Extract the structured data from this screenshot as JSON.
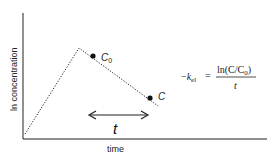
{
  "diagram": {
    "type": "pharmacokinetic log-concentration vs time plot",
    "axes": {
      "xlabel": "time",
      "ylabel": "ln concentration"
    },
    "points": {
      "c0_label": "C",
      "c0_subscript": "0",
      "c_label": "C"
    },
    "interval_label": "t",
    "formula": {
      "lhs_minus": "−",
      "lhs_k": "k",
      "lhs_subscript": "el",
      "equals": "=",
      "numerator": "ln(C/C",
      "numerator_sub": "0",
      "numerator_close": ")",
      "denominator": "t"
    },
    "colors": {
      "line": "#222222",
      "background": "#ffffff"
    }
  }
}
